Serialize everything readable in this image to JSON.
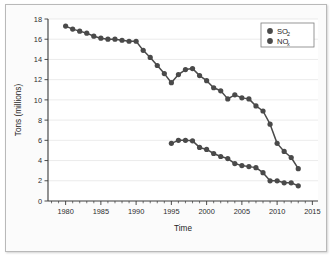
{
  "chart_data": {
    "type": "line",
    "title": "",
    "xlabel": "Time",
    "ylabel": "Tons (millions)",
    "xlim": [
      1977.5,
      2015.8
    ],
    "ylim": [
      0,
      18
    ],
    "grid": true,
    "legend_position": "top-right",
    "y_ticks": [
      0,
      2,
      4,
      6,
      8,
      10,
      12,
      14,
      16,
      18
    ],
    "y_tick_labels": [
      "0",
      "2",
      "4",
      "6",
      "8",
      "10",
      "12",
      "14",
      "16",
      "18"
    ],
    "x_ticks": [
      1980,
      1985,
      1990,
      1995,
      2000,
      2005,
      2010,
      2015
    ],
    "x_tick_labels": [
      "1980",
      "1985",
      "1990",
      "1995",
      "2000",
      "2005",
      "2010",
      "2015"
    ],
    "x_minor_tick_step": 1,
    "marker": "circle",
    "marker_color": "#4a4a4a",
    "line_color": "#4a4a4a",
    "series": [
      {
        "name": "SO2",
        "legend_base": "SO",
        "legend_sub": "2",
        "color": "#4a4a4a",
        "x": [
          1980,
          1981,
          1982,
          1983,
          1984,
          1985,
          1986,
          1987,
          1988,
          1989,
          1990,
          1991,
          1992,
          1993,
          1994,
          1995,
          1996,
          1997,
          1998,
          1999,
          2000,
          2001,
          2002,
          2003,
          2004,
          2005,
          2006,
          2007,
          2008,
          2009,
          2010,
          2011,
          2012,
          2013
        ],
        "values": [
          17.3,
          17.0,
          16.8,
          16.6,
          16.3,
          16.1,
          16.0,
          16.0,
          15.9,
          15.8,
          15.8,
          14.9,
          14.2,
          13.4,
          12.6,
          11.7,
          12.5,
          13.0,
          13.1,
          12.4,
          11.9,
          11.2,
          10.9,
          10.1,
          10.5,
          10.2,
          10.1,
          9.4,
          8.9,
          7.6,
          5.7,
          4.9,
          4.3,
          3.2
        ]
      },
      {
        "name": "NOx",
        "legend_base": "NO",
        "legend_sub": "x",
        "color": "#4a4a4a",
        "x": [
          1995,
          1996,
          1997,
          1998,
          1999,
          2000,
          2001,
          2002,
          2003,
          2004,
          2005,
          2006,
          2007,
          2008,
          2009,
          2010,
          2011,
          2012,
          2013
        ],
        "values": [
          5.7,
          6.0,
          6.0,
          5.95,
          5.3,
          5.1,
          4.7,
          4.4,
          4.2,
          3.7,
          3.5,
          3.4,
          3.3,
          2.8,
          2.0,
          2.0,
          1.8,
          1.8,
          1.5
        ]
      }
    ]
  }
}
